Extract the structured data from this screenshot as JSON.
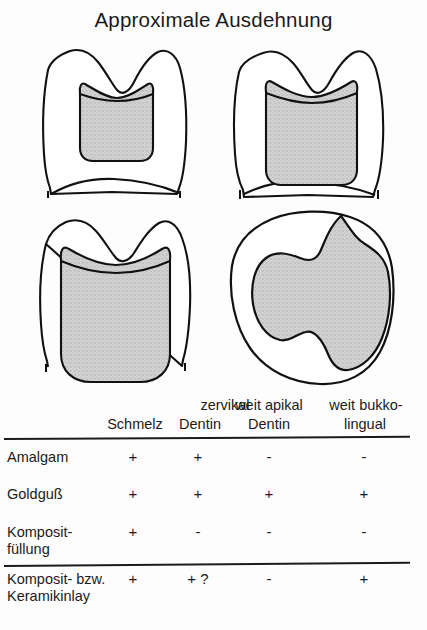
{
  "title": "Approximale Ausdehnung",
  "figures": [
    {
      "name": "tooth-proximal-small-cervical-enamel",
      "caption": "Approximalkasten bis zervikal im Schmelz",
      "view": "proximal",
      "fill_color": "#cccccc",
      "outline_color": "#111111"
    },
    {
      "name": "tooth-proximal-deep-cervical-dentin",
      "caption": "Approximalkasten bis zervikal im Dentin",
      "view": "proximal",
      "fill_color": "#cccccc",
      "outline_color": "#111111"
    },
    {
      "name": "tooth-proximal-weit-apikal",
      "caption": "Weit apikal reichende Praeparation im Dentin",
      "view": "proximal",
      "fill_color": "#cccccc",
      "outline_color": "#111111"
    },
    {
      "name": "tooth-occlusal-weit-bukko-lingual",
      "caption": "Weit bukko-lingual ausgedehnte Praeparation",
      "view": "occlusal",
      "fill_color": "#cccccc",
      "outline_color": "#111111"
    }
  ],
  "table": {
    "group_headers": [
      {
        "label": "zervikal",
        "left": 165,
        "width": 120
      },
      {
        "label": "weit apikal",
        "left": 214,
        "width": 110
      },
      {
        "label": "weit bukko-",
        "left": 316,
        "width": 100
      }
    ],
    "sub_headers": [
      {
        "label": "Schmelz",
        "left": 103,
        "width": 64
      },
      {
        "label": "Dentin",
        "left": 172,
        "width": 56
      },
      {
        "label": "Dentin",
        "left": 241,
        "width": 56
      },
      {
        "label": "lingual",
        "left": 334,
        "width": 62
      }
    ],
    "rows": [
      {
        "label": "Amalgam",
        "values": [
          "+",
          "+",
          "-",
          "-"
        ]
      },
      {
        "label": "Goldguß",
        "values": [
          "+",
          "+",
          "+",
          "+"
        ]
      },
      {
        "label": "Komposit-\nfüllung",
        "values": [
          "+",
          "-",
          "-",
          "-"
        ]
      },
      {
        "label": "Komposit- bzw.\nKeramikinlay",
        "values": [
          "+",
          "+ ?",
          "-",
          "+"
        ]
      }
    ]
  },
  "colors": {
    "background": "#fdfdfd",
    "ink": "#1b1b1b",
    "shading": "#cccccc"
  }
}
